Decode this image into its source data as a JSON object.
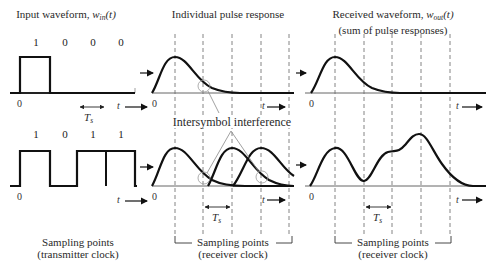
{
  "panels": {
    "input": {
      "title_prefix": "Input waveform, ",
      "title_var": "w",
      "title_sub": "in",
      "title_suffix": "(t)",
      "top_bits": [
        "1",
        "0",
        "0",
        "0"
      ],
      "bottom_bits": [
        "1",
        "0",
        "1",
        "1"
      ],
      "zero_label": "0",
      "t_label": "t",
      "period_label": "T",
      "period_sub": "s",
      "footer_line1": "Sampling points",
      "footer_line2": "(transmitter clock)"
    },
    "pulse": {
      "title": "Individual pulse response",
      "zero_label": "0",
      "t_label": "t",
      "period_label": "T",
      "period_sub": "s",
      "annotation": "Intersymbol interference",
      "footer_line1": "Sampling points",
      "footer_line2": "(receiver clock)"
    },
    "received": {
      "title_prefix": "Received waveform, ",
      "title_var": "w",
      "title_sub": "out",
      "title_suffix": "(t)",
      "title_line2": "(sum of pulse responses)",
      "zero_label": "0",
      "t_label": "t",
      "period_label": "T",
      "period_sub": "s",
      "footer_line1": "Sampling points",
      "footer_line2": "(receiver clock)"
    }
  },
  "colors": {
    "curve": "#111111",
    "axis": "#555555",
    "dashed": "#777777",
    "annotation": "#888888"
  }
}
